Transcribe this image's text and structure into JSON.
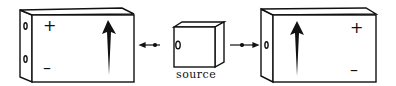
{
  "diagram": {
    "left_plate": {
      "plus": "+",
      "minus": "–",
      "arrow": "up"
    },
    "source": {
      "label": "source"
    },
    "right_plate": {
      "plus": "+",
      "minus": "–",
      "arrow": "up"
    },
    "colors": {
      "line": "#111111",
      "background": "#ffffff"
    }
  }
}
